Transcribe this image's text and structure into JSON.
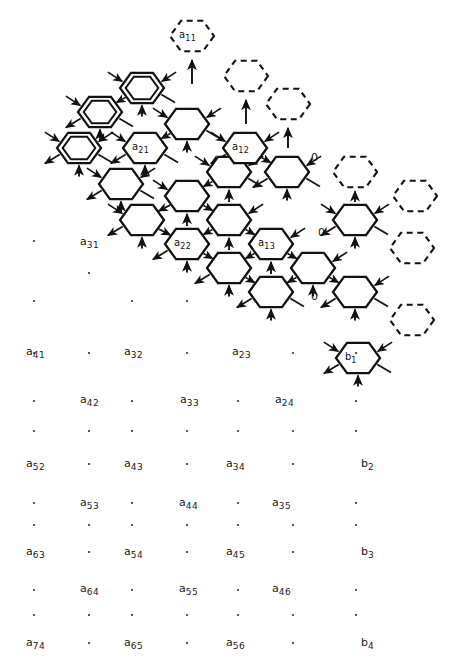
{
  "diagram": {
    "geometry": {
      "hex_radius": 22,
      "step_x": 42,
      "step_y": 48,
      "origin_x": 79,
      "origin_y": 100
    },
    "colors": {
      "ink": "#111111",
      "paper": "#ffffff"
    },
    "cell_styles": {
      "active": "solid",
      "boundary": "double",
      "phantom": "dashed"
    },
    "cells": [
      {
        "id": "c-r0-k0",
        "cx": 79,
        "cy": 148,
        "style": "double",
        "label": ""
      },
      {
        "id": "c-r0-k1",
        "cx": 100,
        "cy": 112,
        "style": "double",
        "label": ""
      },
      {
        "id": "c-r0-k2",
        "cx": 142,
        "cy": 88,
        "style": "double",
        "label": ""
      },
      {
        "id": "c-a1",
        "cx": 121,
        "cy": 184,
        "style": "solid",
        "label": ""
      },
      {
        "id": "c-a2",
        "cx": 145,
        "cy": 148,
        "style": "solid",
        "label": "a21"
      },
      {
        "id": "c-a3",
        "cx": 187,
        "cy": 124,
        "style": "solid",
        "label": ""
      },
      {
        "id": "c-b1",
        "cx": 142,
        "cy": 220,
        "style": "solid",
        "label": ""
      },
      {
        "id": "c-b2",
        "cx": 187,
        "cy": 196,
        "style": "solid",
        "label": ""
      },
      {
        "id": "c-b3",
        "cx": 229,
        "cy": 172,
        "style": "solid",
        "label": ""
      },
      {
        "id": "c-c1",
        "cx": 187,
        "cy": 244,
        "style": "solid",
        "label": "a22"
      },
      {
        "id": "c-c2",
        "cx": 229,
        "cy": 220,
        "style": "solid",
        "label": ""
      },
      {
        "id": "c-c3",
        "cx": 245,
        "cy": 148,
        "style": "solid",
        "label": "a12"
      },
      {
        "id": "c-d1",
        "cx": 229,
        "cy": 268,
        "style": "solid",
        "label": ""
      },
      {
        "id": "c-d2",
        "cx": 271,
        "cy": 244,
        "style": "solid",
        "label": "a13"
      },
      {
        "id": "c-d3",
        "cx": 287,
        "cy": 172,
        "style": "solid",
        "label": ""
      },
      {
        "id": "c-e1",
        "cx": 271,
        "cy": 292,
        "style": "solid",
        "label": ""
      },
      {
        "id": "c-e2",
        "cx": 313,
        "cy": 268,
        "style": "solid",
        "label": ""
      },
      {
        "id": "c-e3",
        "cx": 355,
        "cy": 220,
        "style": "solid",
        "label": ""
      },
      {
        "id": "c-f1",
        "cx": 355,
        "cy": 292,
        "style": "solid",
        "label": ""
      },
      {
        "id": "c-f2",
        "cx": 358,
        "cy": 358,
        "style": "solid",
        "label": "b1"
      },
      {
        "id": "p-a11",
        "cx": 192,
        "cy": 36,
        "style": "dashed",
        "label": "a11"
      },
      {
        "id": "p-t2",
        "cx": 246,
        "cy": 76,
        "style": "dashed",
        "label": ""
      },
      {
        "id": "p-t3",
        "cx": 288,
        "cy": 104,
        "style": "dashed",
        "label": ""
      },
      {
        "id": "p-t4",
        "cx": 355,
        "cy": 172,
        "style": "dashed",
        "label": ""
      },
      {
        "id": "p-t5",
        "cx": 415,
        "cy": 196,
        "style": "dashed",
        "label": ""
      },
      {
        "id": "p-t6",
        "cx": 412,
        "cy": 248,
        "style": "dashed",
        "label": ""
      },
      {
        "id": "p-t7",
        "cx": 412,
        "cy": 320,
        "style": "dashed",
        "label": ""
      }
    ],
    "zero_labels": [
      {
        "text": "0",
        "x": 311,
        "y": 151
      },
      {
        "text": "0",
        "x": 318,
        "y": 226
      },
      {
        "text": "0",
        "x": 311,
        "y": 290
      }
    ],
    "hex_labels": [
      {
        "base": "a",
        "sub": "21",
        "cx": 145,
        "cy": 148
      },
      {
        "base": "a",
        "sub": "12",
        "cx": 245,
        "cy": 148
      },
      {
        "base": "a",
        "sub": "22",
        "cx": 187,
        "cy": 244
      },
      {
        "base": "a",
        "sub": "13",
        "cx": 271,
        "cy": 244
      },
      {
        "base": "a",
        "sub": "11",
        "cx": 192,
        "cy": 36
      },
      {
        "base": "b",
        "sub": "1",
        "cx": 358,
        "cy": 358
      }
    ],
    "matrix_labels": [
      {
        "base": "a",
        "sub": "31",
        "x": 80,
        "y": 236
      },
      {
        "base": "a",
        "sub": "41",
        "x": 26,
        "y": 346
      },
      {
        "base": "a",
        "sub": "32",
        "x": 124,
        "y": 346
      },
      {
        "base": "a",
        "sub": "23",
        "x": 232,
        "y": 346
      },
      {
        "base": "a",
        "sub": "42",
        "x": 80,
        "y": 394
      },
      {
        "base": "a",
        "sub": "33",
        "x": 180,
        "y": 394
      },
      {
        "base": "a",
        "sub": "24",
        "x": 275,
        "y": 394
      },
      {
        "base": "a",
        "sub": "52",
        "x": 26,
        "y": 458
      },
      {
        "base": "a",
        "sub": "43",
        "x": 124,
        "y": 458
      },
      {
        "base": "a",
        "sub": "34",
        "x": 226,
        "y": 458
      },
      {
        "base": "b",
        "sub": "2",
        "x": 361,
        "y": 458
      },
      {
        "base": "a",
        "sub": "53",
        "x": 80,
        "y": 497
      },
      {
        "base": "a",
        "sub": "44",
        "x": 179,
        "y": 497
      },
      {
        "base": "a",
        "sub": "35",
        "x": 272,
        "y": 497
      },
      {
        "base": "a",
        "sub": "63",
        "x": 26,
        "y": 546
      },
      {
        "base": "a",
        "sub": "54",
        "x": 124,
        "y": 546
      },
      {
        "base": "a",
        "sub": "45",
        "x": 226,
        "y": 546
      },
      {
        "base": "b",
        "sub": "3",
        "x": 361,
        "y": 546
      },
      {
        "base": "a",
        "sub": "64",
        "x": 80,
        "y": 583
      },
      {
        "base": "a",
        "sub": "55",
        "x": 179,
        "y": 583
      },
      {
        "base": "a",
        "sub": "46",
        "x": 272,
        "y": 583
      },
      {
        "base": "a",
        "sub": "74",
        "x": 26,
        "y": 637
      },
      {
        "base": "a",
        "sub": "65",
        "x": 124,
        "y": 637
      },
      {
        "base": "a",
        "sub": "56",
        "x": 226,
        "y": 637
      },
      {
        "base": "b",
        "sub": "4",
        "x": 361,
        "y": 637
      }
    ],
    "ellipsis_dots": [
      {
        "x": 33,
        "y": 240
      },
      {
        "x": 88,
        "y": 272
      },
      {
        "x": 33,
        "y": 300
      },
      {
        "x": 131,
        "y": 300
      },
      {
        "x": 186,
        "y": 300
      },
      {
        "x": 33,
        "y": 352
      },
      {
        "x": 88,
        "y": 352
      },
      {
        "x": 186,
        "y": 352
      },
      {
        "x": 292,
        "y": 352
      },
      {
        "x": 355,
        "y": 352
      },
      {
        "x": 33,
        "y": 400
      },
      {
        "x": 131,
        "y": 400
      },
      {
        "x": 237,
        "y": 400
      },
      {
        "x": 355,
        "y": 400
      },
      {
        "x": 33,
        "y": 430
      },
      {
        "x": 88,
        "y": 430
      },
      {
        "x": 131,
        "y": 430
      },
      {
        "x": 186,
        "y": 430
      },
      {
        "x": 237,
        "y": 430
      },
      {
        "x": 292,
        "y": 430
      },
      {
        "x": 355,
        "y": 430
      },
      {
        "x": 88,
        "y": 463
      },
      {
        "x": 186,
        "y": 463
      },
      {
        "x": 292,
        "y": 463
      },
      {
        "x": 33,
        "y": 502
      },
      {
        "x": 131,
        "y": 502
      },
      {
        "x": 237,
        "y": 502
      },
      {
        "x": 355,
        "y": 502
      },
      {
        "x": 33,
        "y": 524
      },
      {
        "x": 88,
        "y": 524
      },
      {
        "x": 131,
        "y": 524
      },
      {
        "x": 186,
        "y": 524
      },
      {
        "x": 237,
        "y": 524
      },
      {
        "x": 292,
        "y": 524
      },
      {
        "x": 355,
        "y": 524
      },
      {
        "x": 88,
        "y": 551
      },
      {
        "x": 186,
        "y": 551
      },
      {
        "x": 292,
        "y": 551
      },
      {
        "x": 33,
        "y": 589
      },
      {
        "x": 131,
        "y": 589
      },
      {
        "x": 237,
        "y": 589
      },
      {
        "x": 355,
        "y": 589
      },
      {
        "x": 33,
        "y": 614
      },
      {
        "x": 88,
        "y": 614
      },
      {
        "x": 131,
        "y": 614
      },
      {
        "x": 186,
        "y": 614
      },
      {
        "x": 237,
        "y": 614
      },
      {
        "x": 292,
        "y": 614
      },
      {
        "x": 355,
        "y": 614
      },
      {
        "x": 88,
        "y": 642
      },
      {
        "x": 186,
        "y": 642
      },
      {
        "x": 292,
        "y": 642
      }
    ]
  }
}
